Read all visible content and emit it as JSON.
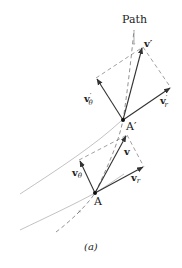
{
  "figure": {
    "caption": "(a)",
    "path_label": "Path",
    "points": {
      "A": {
        "label": "A",
        "x": 95,
        "y": 193
      },
      "A_prime": {
        "label": "A′",
        "x": 123,
        "y": 120
      }
    },
    "vectors_at_A": {
      "v": {
        "label": "v",
        "sub": ""
      },
      "v_theta": {
        "label": "v",
        "sub": "θ"
      },
      "v_r": {
        "label": "v",
        "sub": "r"
      }
    },
    "vectors_at_A_prime": {
      "v": {
        "label": "v′",
        "sub": ""
      },
      "v_theta": {
        "label": "v",
        "sub": "θ",
        "prime": "′"
      },
      "v_r": {
        "label": "v",
        "sub": "r",
        "prime": "′"
      }
    },
    "colors": {
      "line": "#333333",
      "dashed": "#777777",
      "curve": "#888888"
    }
  }
}
